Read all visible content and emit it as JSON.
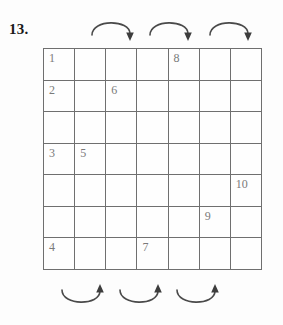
{
  "problem": {
    "number_label": "13."
  },
  "grid": {
    "rows": 7,
    "columns": 7,
    "cells": [
      [
        "1",
        "",
        "",
        "",
        "8",
        "",
        ""
      ],
      [
        "2",
        "",
        "6",
        "",
        "",
        "",
        ""
      ],
      [
        "",
        "",
        "",
        "",
        "",
        "",
        ""
      ],
      [
        "3",
        "5",
        "",
        "",
        "",
        "",
        ""
      ],
      [
        "",
        "",
        "",
        "",
        "",
        "",
        "10"
      ],
      [
        "",
        "",
        "",
        "",
        "",
        "9",
        ""
      ],
      [
        "4",
        "",
        "",
        "7",
        "",
        "",
        ""
      ]
    ],
    "line_color": "#6f6f6f",
    "number_color": "#7a7a7a"
  },
  "arrows": {
    "color": "#4a4a4a",
    "top": [
      {
        "name": "top-arrow-1",
        "direction": "clockwise-down",
        "left": 89,
        "top": 16
      },
      {
        "name": "top-arrow-2",
        "direction": "clockwise-down",
        "left": 147,
        "top": 16
      },
      {
        "name": "top-arrow-3",
        "direction": "clockwise-down",
        "left": 207,
        "top": 16
      }
    ],
    "bottom": [
      {
        "name": "bottom-arrow-1",
        "direction": "clockwise-up",
        "left": 59,
        "top": 286
      },
      {
        "name": "bottom-arrow-2",
        "direction": "clockwise-up",
        "left": 117,
        "top": 286
      },
      {
        "name": "bottom-arrow-3",
        "direction": "clockwise-up",
        "left": 174,
        "top": 286
      }
    ]
  }
}
